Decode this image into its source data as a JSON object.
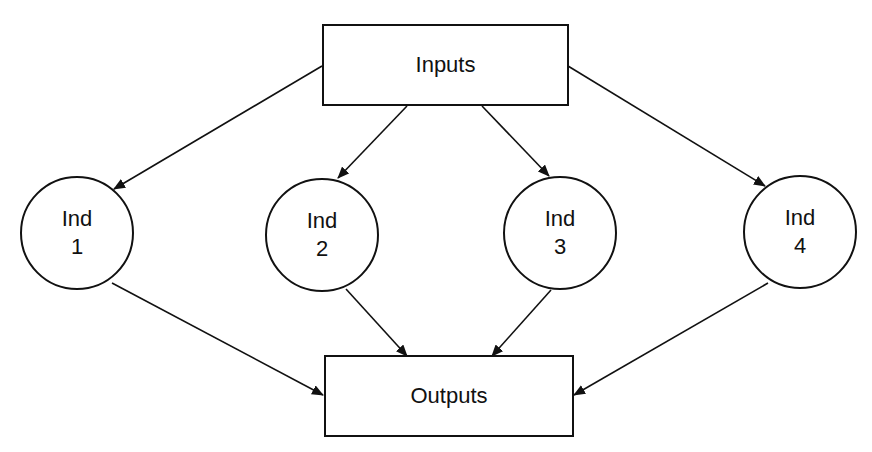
{
  "diagram": {
    "inputs": {
      "label": "Inputs"
    },
    "outputs": {
      "label": "Outputs"
    },
    "nodes": [
      {
        "line1": "Ind",
        "line2": "1"
      },
      {
        "line1": "Ind",
        "line2": "2"
      },
      {
        "line1": "Ind",
        "line2": "3"
      },
      {
        "line1": "Ind",
        "line2": "4"
      }
    ],
    "edges": [
      {
        "from": "Inputs",
        "to": "Ind 1"
      },
      {
        "from": "Inputs",
        "to": "Ind 2"
      },
      {
        "from": "Inputs",
        "to": "Ind 3"
      },
      {
        "from": "Inputs",
        "to": "Ind 4"
      },
      {
        "from": "Ind 1",
        "to": "Outputs"
      },
      {
        "from": "Ind 2",
        "to": "Outputs"
      },
      {
        "from": "Ind 3",
        "to": "Outputs"
      },
      {
        "from": "Ind 4",
        "to": "Outputs"
      }
    ]
  }
}
